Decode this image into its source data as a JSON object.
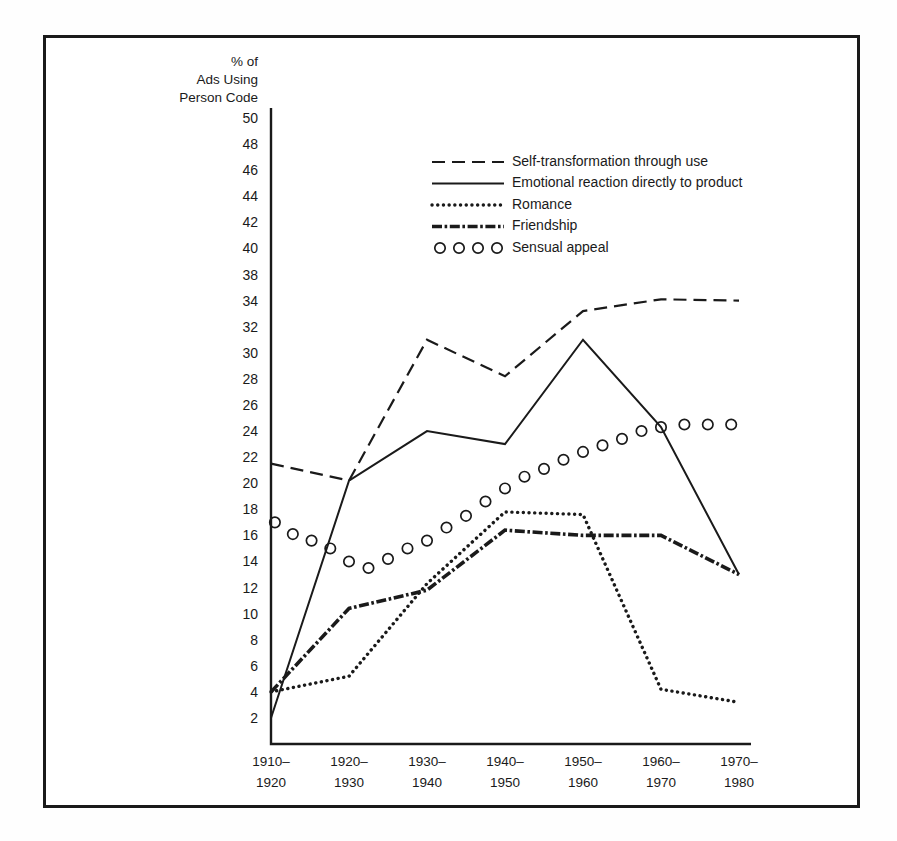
{
  "chart_data": {
    "type": "line",
    "title": "",
    "ylabel": "% of Ads Using Person Code",
    "ylabel_lines": [
      "% of",
      "Ads Using",
      "Person Code"
    ],
    "xlabel": "",
    "categories": [
      "1910-\n1920",
      "1920-\n1930",
      "1930-\n1940",
      "1940-\n1950",
      "1950-\n1960",
      "1960-\n1970",
      "1970-\n1980"
    ],
    "category_lines": [
      [
        "1910–",
        "1920"
      ],
      [
        "1920–",
        "1930"
      ],
      [
        "1930–",
        "1940"
      ],
      [
        "1940–",
        "1950"
      ],
      [
        "1950–",
        "1960"
      ],
      [
        "1960–",
        "1970"
      ],
      [
        "1970–",
        "1980"
      ]
    ],
    "ylim": [
      0,
      51
    ],
    "ytick_labels": [
      "50",
      "48",
      "46",
      "44",
      "42",
      "40",
      "38",
      "34",
      "32",
      "30",
      "28",
      "26",
      "24",
      "22",
      "20",
      "18",
      "16",
      "14",
      "12",
      "10",
      "8",
      "6",
      "4",
      "2"
    ],
    "ytick_values": [
      50,
      48,
      46,
      44,
      42,
      40,
      38,
      34,
      32,
      30,
      28,
      26,
      24,
      22,
      20,
      18,
      16,
      14,
      12,
      10,
      8,
      6,
      4,
      2
    ],
    "grid": false,
    "legend_position": "upper-center",
    "series": [
      {
        "name": "Self-transformation through use",
        "style": "dashed",
        "values": [
          21.5,
          20.2,
          31.0,
          28.2,
          33.2,
          34.2,
          34.0
        ]
      },
      {
        "name": "Emotional reaction directly to product",
        "style": "solid",
        "values": [
          2.0,
          20.2,
          24.0,
          23.0,
          31.0,
          24.3,
          13.0
        ]
      },
      {
        "name": "Romance",
        "style": "dotted",
        "values": [
          4.0,
          5.2,
          12.3,
          17.8,
          17.6,
          4.2,
          3.2
        ]
      },
      {
        "name": "Friendship",
        "style": "dash-dot",
        "values": [
          4.0,
          10.4,
          11.8,
          16.4,
          16.0,
          16.0,
          13.0
        ]
      },
      {
        "name": "Sensual appeal",
        "style": "circles",
        "marker_x_offsets": [
          0.05,
          0.28,
          0.52,
          0.76,
          1.0,
          1.25,
          1.5,
          1.75,
          2.0,
          2.25,
          2.5,
          2.75,
          3.0,
          3.25,
          3.5,
          3.75,
          4.0,
          4.25,
          4.5,
          4.75,
          5.0,
          5.3,
          5.6,
          5.9
        ],
        "marker_values": [
          17.0,
          16.1,
          15.6,
          15.0,
          14.0,
          13.5,
          14.2,
          15.0,
          15.6,
          16.6,
          17.5,
          18.6,
          19.6,
          20.5,
          21.1,
          21.8,
          22.4,
          22.9,
          23.4,
          24.0,
          24.3,
          24.5,
          24.5,
          24.5
        ]
      }
    ],
    "legend": [
      {
        "label": "Self-transformation through use",
        "style": "dashed"
      },
      {
        "label": "Emotional reaction directly to product",
        "style": "solid"
      },
      {
        "label": "Romance",
        "style": "dotted"
      },
      {
        "label": "Friendship",
        "style": "dash-dot"
      },
      {
        "label": "Sensual appeal",
        "style": "circles"
      }
    ],
    "colors": {
      "line": "#1a1a1a",
      "background": "#ffffff",
      "frame": "#1a1a1a"
    }
  }
}
